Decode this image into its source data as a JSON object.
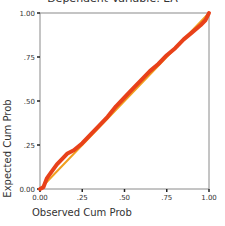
{
  "chart_data": {
    "type": "line",
    "title": "Dependent Variable: EA",
    "xlabel": "Observed Cum Prob",
    "ylabel": "Expected Cum Prob",
    "xlim": [
      0,
      1
    ],
    "ylim": [
      0,
      1
    ],
    "x_ticks": [
      "0.00",
      ".25",
      ".50",
      ".75",
      "1.00"
    ],
    "y_ticks": [
      "0.00",
      ".25",
      ".50",
      ".75",
      "1.00"
    ],
    "grid": false,
    "legend": null,
    "series": [
      {
        "name": "Normal P-P plot",
        "color": "#e8411a",
        "x": [
          0.0,
          0.02,
          0.04,
          0.07,
          0.1,
          0.13,
          0.16,
          0.2,
          0.25,
          0.3,
          0.35,
          0.4,
          0.45,
          0.5,
          0.55,
          0.6,
          0.65,
          0.7,
          0.75,
          0.8,
          0.85,
          0.9,
          0.95,
          0.98,
          1.0
        ],
        "y": [
          0.0,
          0.01,
          0.06,
          0.1,
          0.14,
          0.17,
          0.2,
          0.22,
          0.26,
          0.31,
          0.36,
          0.41,
          0.47,
          0.52,
          0.57,
          0.62,
          0.67,
          0.71,
          0.76,
          0.8,
          0.85,
          0.89,
          0.93,
          0.96,
          1.0
        ]
      },
      {
        "name": "Reference diagonal",
        "color": "#f0a020",
        "x": [
          0,
          1
        ],
        "y": [
          0,
          1
        ]
      }
    ]
  }
}
